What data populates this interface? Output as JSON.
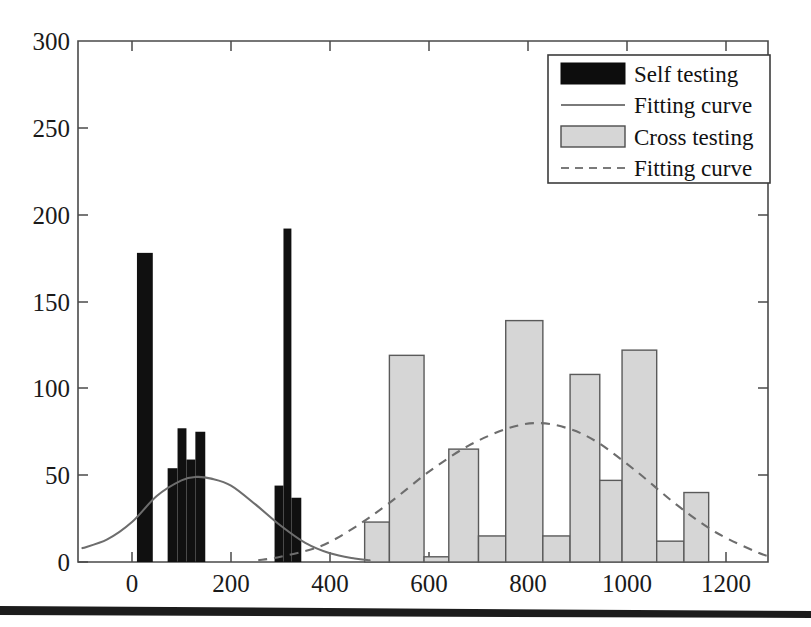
{
  "figure": {
    "background_color": "#ffffff",
    "bar_self_color": "#101010",
    "bar_cross_color": "#d6d6d6",
    "bar_cross_edge_color": "#5a5a5a",
    "curve_color": "#6d6d6d",
    "axis_color": "#4a4a4a"
  },
  "legend": {
    "position": "top-right",
    "items": [
      {
        "label": "Self testing",
        "marker": "filled-black-bar"
      },
      {
        "label": "Fitting curve",
        "marker": "solid-line"
      },
      {
        "label": "Cross testing",
        "marker": "filled-gray-bar"
      },
      {
        "label": "Fitting curve",
        "marker": "dashed-line"
      }
    ]
  },
  "chart_data": {
    "type": "bar",
    "title": "",
    "subtitle": "",
    "xlabel": "",
    "ylabel": "",
    "xlim": [
      -100,
      1290
    ],
    "ylim": [
      0,
      300
    ],
    "grid": false,
    "legend_position": "upper right",
    "xticks": [
      0,
      200,
      400,
      600,
      800,
      1000,
      1200
    ],
    "xtick_labels": [
      "0",
      "200",
      "400",
      "600",
      "800",
      "1000",
      "1200"
    ],
    "yticks": [
      0,
      50,
      100,
      150,
      200,
      250,
      300
    ],
    "ytick_labels": [
      "0",
      "50",
      "100",
      "150",
      "200",
      "250",
      "300"
    ],
    "series": [
      {
        "name": "Self testing",
        "type": "bar",
        "color": "#101010",
        "bars": [
          {
            "x_left": 10,
            "x_right": 42,
            "value": 178
          },
          {
            "x_left": 72,
            "x_right": 92,
            "value": 54
          },
          {
            "x_left": 92,
            "x_right": 110,
            "value": 77
          },
          {
            "x_left": 110,
            "x_right": 128,
            "value": 59
          },
          {
            "x_left": 128,
            "x_right": 148,
            "value": 75
          },
          {
            "x_left": 288,
            "x_right": 306,
            "value": 44
          },
          {
            "x_left": 306,
            "x_right": 322,
            "value": 192
          },
          {
            "x_left": 322,
            "x_right": 342,
            "value": 37
          }
        ]
      },
      {
        "name": "Cross testing",
        "type": "bar",
        "color": "#d6d6d6",
        "bars": [
          {
            "x_left": 470,
            "x_right": 520,
            "value": 23
          },
          {
            "x_left": 520,
            "x_right": 590,
            "value": 119
          },
          {
            "x_left": 590,
            "x_right": 640,
            "value": 3
          },
          {
            "x_left": 640,
            "x_right": 700,
            "value": 65
          },
          {
            "x_left": 700,
            "x_right": 755,
            "value": 15
          },
          {
            "x_left": 755,
            "x_right": 830,
            "value": 139
          },
          {
            "x_left": 830,
            "x_right": 885,
            "value": 15
          },
          {
            "x_left": 885,
            "x_right": 945,
            "value": 108
          },
          {
            "x_left": 945,
            "x_right": 990,
            "value": 47
          },
          {
            "x_left": 990,
            "x_right": 1060,
            "value": 122
          },
          {
            "x_left": 1060,
            "x_right": 1115,
            "value": 12
          },
          {
            "x_left": 1115,
            "x_right": 1165,
            "value": 40
          }
        ]
      },
      {
        "name": "Fitting curve (self)",
        "type": "line",
        "style": "solid",
        "color": "#6d6d6d",
        "x": [
          -100,
          -50,
          0,
          50,
          100,
          130,
          160,
          200,
          250,
          300,
          350,
          400,
          450,
          480
        ],
        "y": [
          8,
          13,
          23,
          38,
          47,
          49,
          48,
          44,
          33,
          21,
          11,
          5,
          2,
          1
        ]
      },
      {
        "name": "Fitting curve (cross)",
        "type": "line",
        "style": "dashed",
        "color": "#6d6d6d",
        "x": [
          255,
          300,
          380,
          450,
          520,
          600,
          680,
          760,
          820,
          880,
          940,
          1020,
          1100,
          1180,
          1260,
          1290
        ],
        "y": [
          1,
          3,
          9,
          20,
          34,
          52,
          67,
          77,
          80,
          77,
          69,
          52,
          33,
          17,
          6,
          3
        ]
      }
    ]
  }
}
